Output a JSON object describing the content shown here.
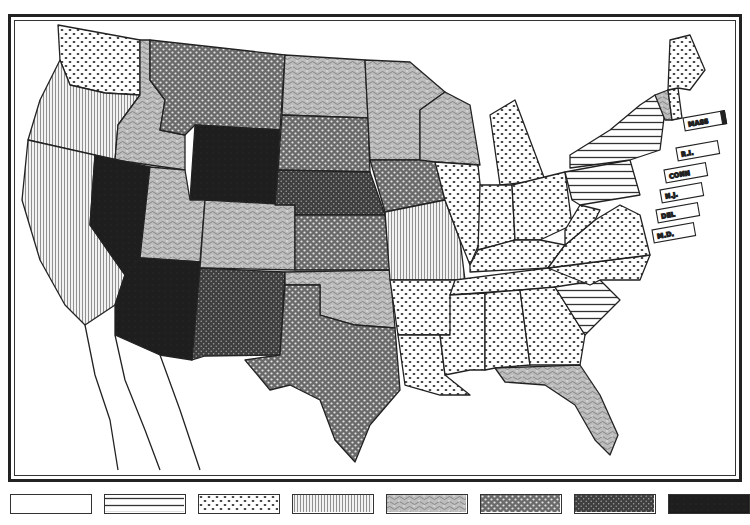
{
  "map": {
    "type": "choropleth",
    "region": "United States (contiguous)",
    "classes": 8,
    "pattern_legend": [
      {
        "class": 1,
        "pattern": "blank",
        "pattern_name": "white"
      },
      {
        "class": 2,
        "pattern": "horizontal-lines",
        "pattern_name": "horizontal lines"
      },
      {
        "class": 3,
        "pattern": "sparse-dots",
        "pattern_name": "dots"
      },
      {
        "class": 4,
        "pattern": "vertical-lines",
        "pattern_name": "vertical lines"
      },
      {
        "class": 5,
        "pattern": "squiggle",
        "pattern_name": "gray squiggle"
      },
      {
        "class": 6,
        "pattern": "dense-dots",
        "pattern_name": "dense dots"
      },
      {
        "class": 7,
        "pattern": "dark-dots",
        "pattern_name": "dark dotted"
      },
      {
        "class": 8,
        "pattern": "solid-dark",
        "pattern_name": "black"
      }
    ],
    "states": {
      "WA": 3,
      "OR": 4,
      "CA": 4,
      "ID": 5,
      "NV": 8,
      "MT": 6,
      "WY": 8,
      "UT": 5,
      "AZ": 8,
      "CO": 5,
      "NM": 7,
      "ND": 5,
      "SD": 6,
      "NE": 7,
      "KS": 6,
      "OK": 5,
      "TX": 6,
      "MN": 5,
      "IA": 6,
      "MO": 4,
      "AR": 3,
      "LA": 3,
      "WI": 5,
      "IL": 3,
      "MI": 3,
      "IN": 3,
      "OH": 3,
      "KY": 3,
      "TN": 3,
      "MS": 3,
      "AL": 3,
      "GA": 3,
      "FL": 5,
      "SC": 2,
      "NC": 3,
      "VA": 3,
      "WV": 3,
      "PA": 2,
      "NY": 2,
      "VT": 5,
      "NH": 3,
      "ME": 3
    },
    "callouts": [
      {
        "id": "mass",
        "label": "MASS"
      },
      {
        "id": "ri",
        "label": "R.I."
      },
      {
        "id": "conn",
        "label": "CONN"
      },
      {
        "id": "nj",
        "label": "N.J."
      },
      {
        "id": "del",
        "label": "DEL"
      },
      {
        "id": "md",
        "label": "M.D."
      }
    ]
  },
  "colors": {
    "ink": "#222222",
    "paper": "#ffffff",
    "gray_light": "#d9d9d9",
    "gray_mid": "#9a9a9a",
    "gray_dark": "#555555",
    "black": "#1a1a1a"
  }
}
